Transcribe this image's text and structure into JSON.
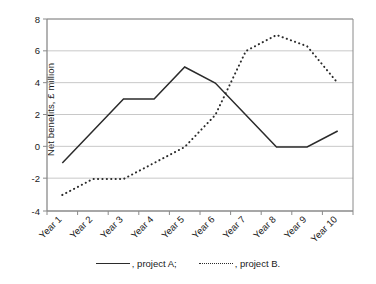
{
  "chart_data": {
    "type": "line",
    "title": "",
    "subtitle": "",
    "xlabel": "",
    "ylabel": "Net benefits, £ million",
    "categories": [
      "Year 1",
      "Year 2",
      "Year 3",
      "Year 4",
      "Year 5",
      "Year 6",
      "Year 7",
      "Year 8",
      "Year 9",
      "Year 10"
    ],
    "series": [
      {
        "name": ", project A;",
        "style": "solid",
        "color": "#2b2b2b",
        "values": [
          -1,
          1,
          3,
          3,
          5,
          4,
          2,
          0,
          0,
          1
        ]
      },
      {
        "name": ", project B.",
        "style": "dotted",
        "color": "#2b2b2b",
        "values": [
          -3,
          -2,
          -2,
          -1,
          0,
          2,
          6,
          7,
          6.3,
          4
        ]
      }
    ],
    "ylim": [
      -4,
      8
    ],
    "yticks": [
      8,
      6,
      4,
      2,
      0,
      -2,
      -4
    ],
    "ytick_labels": [
      "8",
      "6",
      "4",
      "2",
      "0",
      "-2",
      "-4"
    ],
    "grid": "horizontal",
    "grid_color": "#c8c8c8",
    "axis_color": "#808080",
    "legend_position": "bottom-center",
    "xtick_rotation": -45
  },
  "legend": {
    "entries": [
      {
        "label": ", project A;",
        "swatch": "solid-line-swatch"
      },
      {
        "label": ", project B.",
        "swatch": "dotted-line-swatch"
      }
    ]
  }
}
